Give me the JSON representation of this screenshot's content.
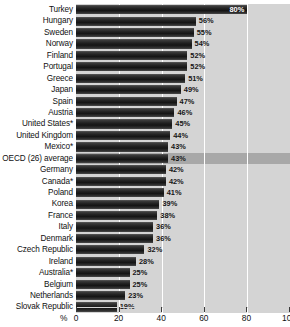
{
  "chart_data": {
    "type": "bar",
    "orientation": "horizontal",
    "title": "",
    "subtitle": "",
    "xlabel": "%",
    "ylabel": "",
    "xlim": [
      0,
      100
    ],
    "xticks": [
      0,
      20,
      40,
      60,
      80,
      100
    ],
    "grid": true,
    "legend": null,
    "value_suffix": "%",
    "highlight_category": "OECD (26) average",
    "categories": [
      "Turkey",
      "Hungary",
      "Sweden",
      "Norway",
      "Finland",
      "Portugal",
      "Greece",
      "Japan",
      "Spain",
      "Austria",
      "United States*",
      "United Kingdom",
      "Mexico*",
      "OECD (26) average",
      "Germany",
      "Canada*",
      "Poland",
      "Korea",
      "France",
      "Italy",
      "Denmark",
      "Czech Republic",
      "Ireland",
      "Australia*",
      "Belgium",
      "Netherlands",
      "Slovak Republic"
    ],
    "values": [
      80,
      56,
      55,
      54,
      52,
      52,
      51,
      49,
      47,
      46,
      45,
      44,
      43,
      43,
      42,
      42,
      41,
      39,
      38,
      36,
      36,
      32,
      28,
      25,
      25,
      23,
      19
    ],
    "labels": [
      "80%",
      "56%",
      "55%",
      "54%",
      "52%",
      "52%",
      "51%",
      "49%",
      "47%",
      "46%",
      "45%",
      "44%",
      "43%",
      "43%",
      "42%",
      "42%",
      "41%",
      "39%",
      "38%",
      "36%",
      "36%",
      "32%",
      "28%",
      "25%",
      "25%",
      "23%",
      "19%"
    ],
    "colors": {
      "bar_dark": "#1a1a1a",
      "bar_light": "#5a5a5a",
      "plot_background": "#d4d4d4",
      "highlight_background": "#a8a8a8",
      "gridline": "#ffffff",
      "text": "#111111",
      "value_text": "#161616"
    }
  },
  "axis": {
    "percent_symbol": "%",
    "tick_labels": [
      "0",
      "20",
      "40",
      "60",
      "80",
      "100"
    ]
  }
}
